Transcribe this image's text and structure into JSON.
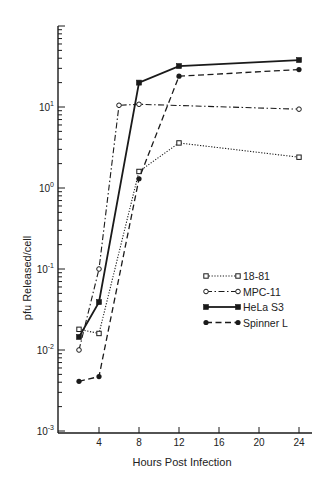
{
  "chart_data": {
    "type": "line",
    "title": "",
    "xlabel": "Hours Post Infection",
    "ylabel": "pfu Released/cell",
    "xlim": [
      0,
      25
    ],
    "ylim": [
      0.001,
      100
    ],
    "yscale": "log",
    "xticks": [
      4,
      8,
      12,
      16,
      20,
      24
    ],
    "xtick_labels": [
      "4",
      "8",
      "12",
      "16",
      "20",
      "24"
    ],
    "yticks": [
      {
        "value": 10,
        "base": "10",
        "exp": "1"
      },
      {
        "value": 1,
        "base": "10",
        "exp": "0"
      },
      {
        "value": 0.1,
        "base": "10",
        "exp": "-1"
      },
      {
        "value": 0.01,
        "base": "10",
        "exp": "-2"
      },
      {
        "value": 0.001,
        "base": "10",
        "exp": "-3"
      }
    ],
    "grid": false,
    "legend_position": "center-right",
    "series": [
      {
        "name": "18-81",
        "marker": "open-square",
        "line_style": "dotted",
        "x": [
          2,
          4,
          8,
          12,
          24
        ],
        "values": [
          0.018,
          0.016,
          1.6,
          3.6,
          2.4
        ]
      },
      {
        "name": "MPC-11",
        "marker": "open-circle",
        "line_style": "dash-dot",
        "x": [
          2,
          4,
          6,
          8,
          24
        ],
        "values": [
          0.01,
          0.1,
          10.5,
          10.8,
          9.4
        ]
      },
      {
        "name": "HeLa S3",
        "marker": "filled-square",
        "line_style": "solid",
        "x": [
          2,
          4,
          8,
          12,
          24
        ],
        "values": [
          0.0145,
          0.039,
          20,
          32,
          38
        ]
      },
      {
        "name": "Spinner L",
        "marker": "filled-circle",
        "line_style": "dashed",
        "x": [
          2,
          4,
          8,
          12,
          24
        ],
        "values": [
          0.0041,
          0.0047,
          1.3,
          24,
          29
        ]
      }
    ]
  }
}
